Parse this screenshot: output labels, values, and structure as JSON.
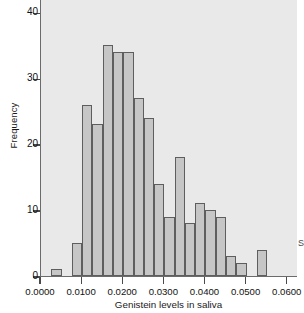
{
  "chart_data": {
    "type": "bar",
    "title": "",
    "subtitle": "",
    "xlabel": "Genistein levels in saliva",
    "ylabel": "Frequency",
    "grid": false,
    "legend": null,
    "legend_position": "none",
    "bin_width": 0.0025,
    "bin_start": 0.0025,
    "xlim": [
      0.0,
      0.0625
    ],
    "ylim": [
      0,
      42
    ],
    "xticks": [
      0.0,
      0.01,
      0.02,
      0.03,
      0.04,
      0.05,
      0.06
    ],
    "xticklabels": [
      "0.0000",
      "0.0100",
      "0.0200",
      "0.0300",
      "0.0400",
      "0.0500",
      "0.0600"
    ],
    "yticks": [
      0,
      10,
      20,
      30,
      40
    ],
    "yticklabels": [
      "0",
      "10",
      "20",
      "30",
      "40"
    ],
    "bin_edges": [
      0.0025,
      0.005,
      0.0075,
      0.01,
      0.0125,
      0.015,
      0.0175,
      0.02,
      0.0225,
      0.025,
      0.0275,
      0.03,
      0.0325,
      0.035,
      0.0375,
      0.04,
      0.0425,
      0.045,
      0.0475,
      0.05,
      0.0525,
      0.055
    ],
    "categories": [
      "0.0025-0.0050",
      "0.0050-0.0075",
      "0.0075-0.0100",
      "0.0100-0.0125",
      "0.0125-0.0150",
      "0.0150-0.0175",
      "0.0175-0.0200",
      "0.0200-0.0225",
      "0.0225-0.0250",
      "0.0250-0.0275",
      "0.0275-0.0300",
      "0.0300-0.0325",
      "0.0325-0.0350",
      "0.0350-0.0375",
      "0.0375-0.0400",
      "0.0400-0.0425",
      "0.0425-0.0450",
      "0.0450-0.0475",
      "0.0475-0.0500",
      "0.0500-0.0525",
      "0.0525-0.0550"
    ],
    "values": [
      1,
      0,
      5,
      26,
      23,
      35,
      34,
      34,
      27,
      24,
      14,
      9,
      18,
      8,
      11,
      10,
      9,
      3,
      2,
      0,
      4
    ],
    "bar_color": "#c6c6c6",
    "bar_edge_color": "#5e5e5e",
    "plot_background": "#e9e9e9",
    "figure_background": "#ffffff",
    "axis_color": "#4a4a4a"
  },
  "edge": {
    "clipped_glyph": "S"
  }
}
